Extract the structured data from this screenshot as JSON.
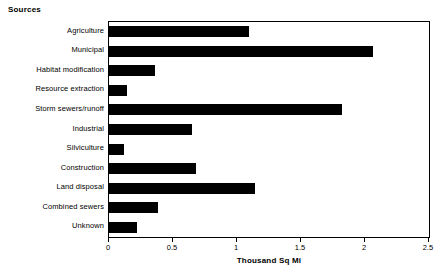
{
  "chart_data": {
    "type": "bar",
    "orientation": "horizontal",
    "title": "Sources",
    "subtitle": "",
    "xlabel": "Thousand Sq Mi",
    "ylabel": "",
    "xlim": [
      0,
      2.5
    ],
    "xticks": [
      "0",
      "0.5",
      "1",
      "1.5",
      "2",
      "2.5"
    ],
    "xtick_values": [
      0,
      0.5,
      1,
      1.5,
      2,
      2.5
    ],
    "grid": false,
    "legend": false,
    "bar_color": "#000000",
    "background_color": "#FFFFFF",
    "axis_color": "#000000",
    "categories": [
      "Agriculture",
      "Municipal",
      "Habitat modification",
      "Resource extraction",
      "Storm sewers/runoff",
      "Industrial",
      "Silviculture",
      "Construction",
      "Land disposal",
      "Combined sewers",
      "Unknown"
    ],
    "values": [
      1.09,
      2.06,
      0.36,
      0.14,
      1.82,
      0.65,
      0.12,
      0.68,
      1.14,
      0.38,
      0.22
    ]
  }
}
